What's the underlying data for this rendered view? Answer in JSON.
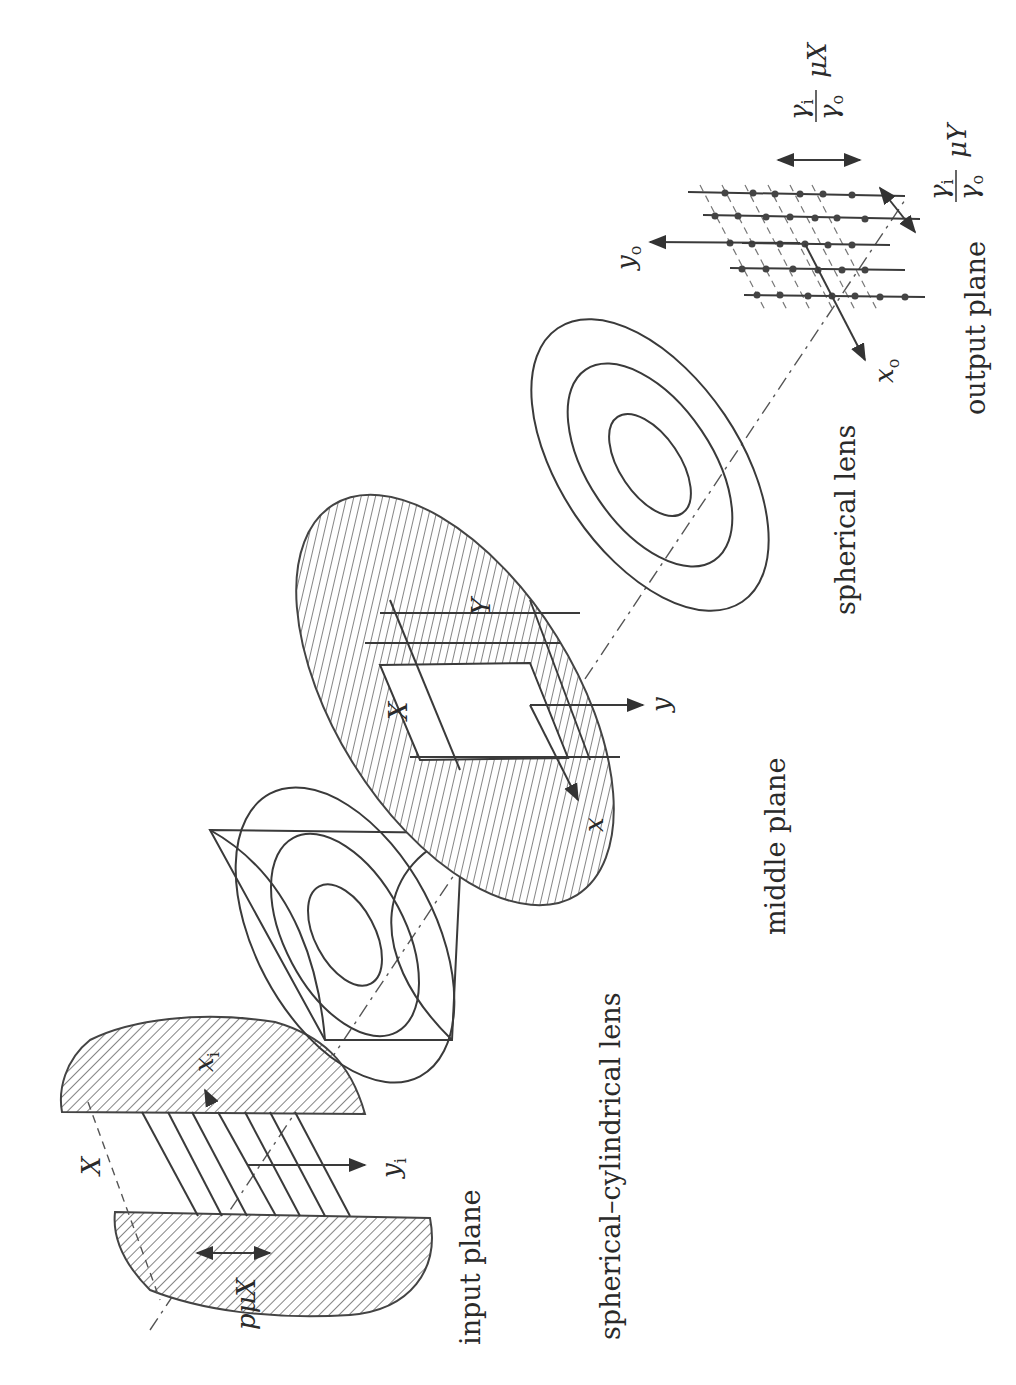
{
  "figure": {
    "orientation": "rotated-90-ccw",
    "labels": {
      "input_plane": "input plane",
      "spherical_cylindrical_lens": "spherical–cylindrical lens",
      "middle_plane": "middle plane",
      "spherical_lens": "spherical lens",
      "output_plane": "output plane"
    },
    "symbols": {
      "input_X": "X",
      "input_xi": "x",
      "input_xi_sub": "i",
      "input_yi": "y",
      "input_yi_sub": "i",
      "input_period": "pμX",
      "middle_X": "X",
      "middle_Y": "Y",
      "middle_x": "x",
      "middle_y": "y",
      "output_xo": "x",
      "output_xo_sub": "o",
      "output_yo": "y",
      "output_yo_sub": "o",
      "output_spacing_x_num": "γ",
      "output_spacing_x_num_sub": "i",
      "output_spacing_x_den": "γ",
      "output_spacing_x_den_sub": "o",
      "output_spacing_x_factor": "μX",
      "output_spacing_y_num": "γ",
      "output_spacing_y_num_sub": "i",
      "output_spacing_y_den": "γ",
      "output_spacing_y_den_sub": "o",
      "output_spacing_y_factor": "μY"
    }
  }
}
